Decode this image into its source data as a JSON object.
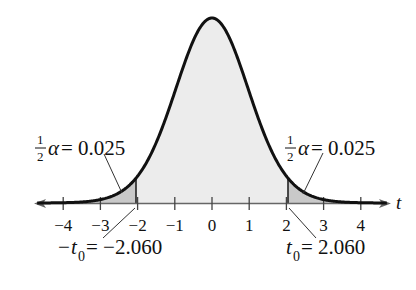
{
  "chart_data": {
    "type": "area",
    "title": "",
    "xlabel": "t",
    "ylabel": "",
    "xlim": [
      -4.8,
      4.8
    ],
    "x_ticks": [
      -4,
      -3,
      -2,
      -1,
      0,
      1,
      2,
      3,
      4
    ],
    "x_tick_labels": [
      "−4",
      "−3",
      "−2",
      "−1",
      "0",
      "1",
      "2",
      "3",
      "4"
    ],
    "grid": false,
    "legend": "none",
    "critical_values": [
      -2.06,
      2.06
    ],
    "shaded_tails": [
      {
        "side": "left",
        "from": -4.8,
        "to": -2.06,
        "area": 0.025
      },
      {
        "side": "right",
        "from": 2.06,
        "to": 4.8,
        "area": 0.025
      }
    ],
    "center_region": {
      "from": -2.06,
      "to": 2.06,
      "area": 0.95
    },
    "annotations": [
      {
        "text": "½α = 0.025",
        "target": "left tail"
      },
      {
        "text": "½α = 0.025",
        "target": "right tail"
      },
      {
        "text": "−t₀ = −2.060",
        "target": "x = -2.060"
      },
      {
        "text": "t₀ = 2.060",
        "target": "x = 2.060"
      }
    ],
    "colors": {
      "curve": "#111111",
      "center_fill": "#ececec",
      "tail_fill": "#c9c9c9",
      "axis": "#555555"
    }
  },
  "labels": {
    "axis_variable": "t",
    "ticks": [
      "−4",
      "−3",
      "−2",
      "−1",
      "0",
      "1",
      "2",
      "3",
      "4"
    ],
    "left_alpha": {
      "num": "1",
      "den": "2",
      "symbol": "α",
      "equals": " = 0.025"
    },
    "right_alpha": {
      "num": "1",
      "den": "2",
      "symbol": "α",
      "equals": " = 0.025"
    },
    "left_crit": {
      "minus": "−",
      "var": "t",
      "sub": "0",
      "rest": " = −2.060"
    },
    "right_crit": {
      "var": "t",
      "sub": "0",
      "rest": " = 2.060"
    }
  }
}
